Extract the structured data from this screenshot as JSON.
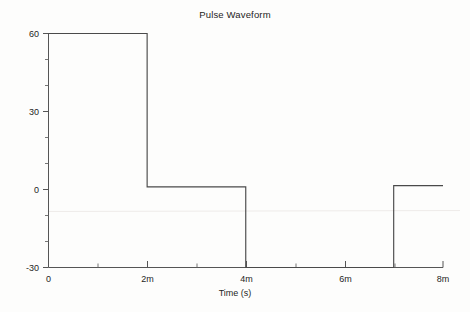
{
  "chart": {
    "title": "Pulse Waveform",
    "xlabel": "Time (s)",
    "ylabel": "Voltage (V)"
  },
  "chart_data": {
    "type": "line",
    "title": "Pulse Waveform",
    "xlabel": "Time (s)",
    "ylabel": "Voltage (V)",
    "xlim": [
      0,
      8
    ],
    "ylim": [
      -30,
      60
    ],
    "x_unit": "m",
    "x_ticks": [
      0,
      2,
      4,
      6,
      8
    ],
    "x_tick_labels": [
      "0",
      "2m",
      "4m",
      "6m",
      "8m"
    ],
    "x_minor_ticks": [
      1,
      3,
      5,
      7
    ],
    "y_ticks": [
      -30,
      0,
      30,
      60
    ],
    "y_tick_labels": [
      "-30",
      "0",
      "30",
      "60"
    ],
    "y_minor_ticks": [
      -20,
      -10,
      10,
      20,
      40,
      50
    ],
    "grid": false,
    "legend": false,
    "series": [
      {
        "name": "Voltage",
        "x": [
          0,
          2,
          2,
          4,
          4,
          7,
          7,
          8
        ],
        "values": [
          60,
          60,
          1,
          1,
          -30,
          -30,
          1.5,
          1.5
        ]
      }
    ],
    "annotations": []
  },
  "ticks": {
    "y": [
      {
        "label": "60",
        "value": 60
      },
      {
        "label": "30",
        "value": 30
      },
      {
        "label": "0",
        "value": 0
      },
      {
        "label": "-30",
        "value": -30
      }
    ],
    "x": [
      {
        "label": "0",
        "value": 0
      },
      {
        "label": "2m",
        "value": 2
      },
      {
        "label": "4m",
        "value": 4
      },
      {
        "label": "6m",
        "value": 6
      },
      {
        "label": "8m",
        "value": 8
      }
    ]
  }
}
